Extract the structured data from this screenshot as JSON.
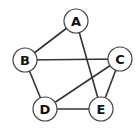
{
  "diagram": {
    "type": "undirected-graph",
    "node_radius": 12,
    "colors": {
      "edge": "#333333",
      "node_fill": "#ffffff",
      "node_stroke": "#444444",
      "label": "#111111"
    },
    "nodes": [
      {
        "id": "A",
        "label": "A",
        "x": 76,
        "y": 21
      },
      {
        "id": "B",
        "label": "B",
        "x": 25,
        "y": 60
      },
      {
        "id": "C",
        "label": "C",
        "x": 120,
        "y": 59
      },
      {
        "id": "D",
        "label": "D",
        "x": 45,
        "y": 109
      },
      {
        "id": "E",
        "label": "E",
        "x": 101,
        "y": 109
      }
    ],
    "edges": [
      {
        "from": "A",
        "to": "B"
      },
      {
        "from": "A",
        "to": "E"
      },
      {
        "from": "B",
        "to": "C"
      },
      {
        "from": "B",
        "to": "D"
      },
      {
        "from": "C",
        "to": "D"
      },
      {
        "from": "C",
        "to": "E"
      },
      {
        "from": "D",
        "to": "E"
      }
    ]
  }
}
